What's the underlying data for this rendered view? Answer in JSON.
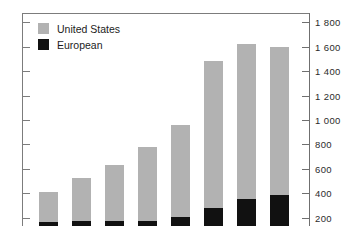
{
  "chart_data": {
    "type": "bar",
    "title": "",
    "subtitle": "",
    "xlabel": "",
    "ylabel": "",
    "stacked": true,
    "grid": false,
    "y_axis_position": "right",
    "ylim": [
      0,
      1800
    ],
    "yticks": [
      200,
      400,
      600,
      800,
      1000,
      1200,
      1400,
      1600,
      1800
    ],
    "ytick_labels": [
      "200",
      "400",
      "600",
      "800",
      "1 000",
      "1 200",
      "1 400",
      "1 600",
      "1 800"
    ],
    "categories": [
      "1",
      "2",
      "3",
      "4",
      "5",
      "6",
      "7",
      "8"
    ],
    "legend_position": "top-left",
    "series": [
      {
        "name": "United States",
        "color": "#b2b2b2",
        "values": [
          245,
          350,
          455,
          605,
          755,
          1205,
          1275,
          1215
        ]
      },
      {
        "name": "European",
        "color": "#111111",
        "values": [
          165,
          175,
          175,
          175,
          205,
          280,
          350,
          385
        ]
      }
    ],
    "totals": [
      410,
      525,
      630,
      780,
      960,
      1485,
      1625,
      1600
    ]
  },
  "legend": {
    "items": [
      {
        "label": "United States",
        "color": "#b2b2b2"
      },
      {
        "label": "European",
        "color": "#111111"
      }
    ]
  },
  "axis": {
    "ticks": [
      {
        "label": "1 800",
        "value": 1800
      },
      {
        "label": "1 600",
        "value": 1600
      },
      {
        "label": "1 400",
        "value": 1400
      },
      {
        "label": "1 200",
        "value": 1200
      },
      {
        "label": "1 000",
        "value": 1000
      },
      {
        "label": "800",
        "value": 800
      },
      {
        "label": "600",
        "value": 600
      },
      {
        "label": "400",
        "value": 400
      },
      {
        "label": "200",
        "value": 200
      }
    ]
  }
}
